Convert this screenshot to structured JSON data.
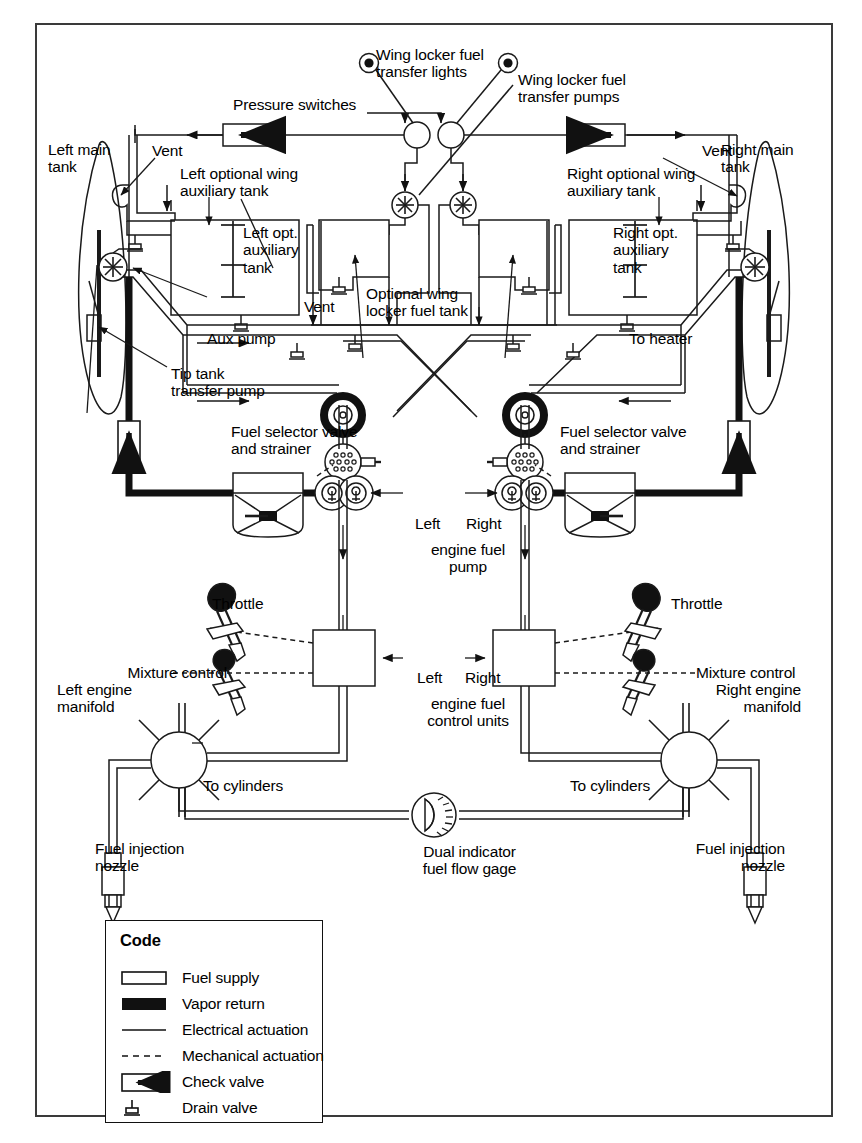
{
  "diagram": {
    "frame": {
      "border_color": "#3a3a3a"
    }
  },
  "labels": {
    "left_main_tank": "Left main\ntank",
    "right_main_tank": "Right main\ntank",
    "pressure_switches": "Pressure switches",
    "wing_locker_transfer_lights": "Wing locker fuel\ntransfer lights",
    "wing_locker_transfer_pumps": "Wing locker fuel\ntransfer pumps",
    "vent_left": "Vent",
    "vent_right": "Vent",
    "vent_center": "Vent",
    "left_optional_wing_aux_tank": "Left optional wing\nauxiliary tank",
    "right_optional_wing_aux_tank": "Right optional wing\nauxiliary tank",
    "left_opt_aux_tank": "Left opt.\nauxiliary\ntank",
    "right_opt_aux_tank": "Right opt.\nauxiliary\ntank",
    "optional_wing_locker_fuel_tank": "Optional wing\nlocker fuel tank",
    "aux_pump": "Aux pump",
    "to_heater": "To heater",
    "tip_tank_transfer_pump": "Tip tank\ntransfer pump",
    "fuel_selector_valve_left": "Fuel selector valve\nand strainer",
    "fuel_selector_valve_right": "Fuel selector valve\nand strainer",
    "engine_fuel_pump_left_word": "Left",
    "engine_fuel_pump_right_word": "Right",
    "engine_fuel_pump": "engine fuel\npump",
    "engine_fuel_control_left_word": "Left",
    "engine_fuel_control_right_word": "Right",
    "engine_fuel_control_units": "engine fuel\ncontrol units",
    "throttle_left": "Throttle",
    "throttle_right": "Throttle",
    "mixture_control_left": "Mixture control",
    "mixture_control_right": "Mixture control",
    "left_engine_manifold": "Left engine\nmanifold",
    "right_engine_manifold": "Right engine\nmanifold",
    "to_cylinders_left": "To cylinders",
    "to_cylinders_right": "To cylinders",
    "fuel_injection_nozzle_left": "Fuel injection\nnozzle",
    "fuel_injection_nozzle_right": "Fuel injection\nnozzle",
    "dual_indicator_fuel_flow_gage": "Dual indicator\nfuel flow gage"
  },
  "legend": {
    "title": "Code",
    "items": [
      {
        "symbol": "fuel-supply",
        "label": "Fuel supply"
      },
      {
        "symbol": "vapor-return",
        "label": "Vapor return"
      },
      {
        "symbol": "electrical-actuation",
        "label": "Electrical actuation"
      },
      {
        "symbol": "mechanical-actuation",
        "label": "Mechanical actuation"
      },
      {
        "symbol": "check-valve",
        "label": "Check valve"
      },
      {
        "symbol": "drain-valve",
        "label": "Drain valve"
      }
    ]
  },
  "colors": {
    "line": "#1a1a1a",
    "vapor_fill": "#111111",
    "paper": "#ffffff",
    "frame": "#3a3a3a"
  }
}
